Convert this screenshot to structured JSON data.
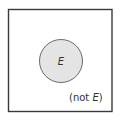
{
  "diagram": {
    "type": "venn",
    "universe": {
      "label": "(not E)",
      "label_prefix": "(not ",
      "label_var": "E",
      "label_suffix": ")"
    },
    "set": {
      "label": "E"
    },
    "colors": {
      "border": "#3a3a3a",
      "circle_fill": "#e4e4e4",
      "circle_stroke": "#6a6a6a",
      "text": "#333333"
    }
  }
}
